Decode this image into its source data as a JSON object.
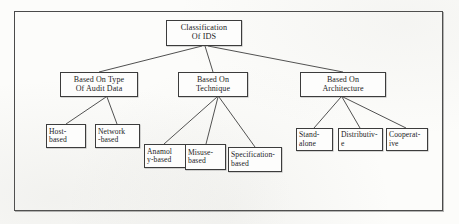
{
  "diagram": {
    "title": "Classification Of IDS",
    "type": "tree",
    "frame": {
      "present": true,
      "color": "#4a4a4a"
    },
    "root": {
      "id": "root",
      "line1": "Classification",
      "line2": "Of  IDS"
    },
    "branches": [
      {
        "id": "audit",
        "line1": "Based On Type",
        "line2": "Of Audit Data",
        "children": [
          {
            "id": "host",
            "line1": "Host-",
            "line2": "based"
          },
          {
            "id": "network",
            "line1": "Network",
            "line2": "-based"
          }
        ]
      },
      {
        "id": "technique",
        "line1": "Based On",
        "line2": "Technique",
        "children": [
          {
            "id": "anamoly",
            "line1": "Anamol",
            "line2": "y-based"
          },
          {
            "id": "misuse",
            "line1": "Misuse-",
            "line2": "based"
          },
          {
            "id": "spec",
            "line1": "Specification-",
            "line2": "based"
          }
        ]
      },
      {
        "id": "architecture",
        "line1": "Based On",
        "line2": "Architecture",
        "children": [
          {
            "id": "stand",
            "line1": "Stand-",
            "line2": "alone"
          },
          {
            "id": "distrib",
            "line1": "Distributiv-",
            "line2": "e"
          },
          {
            "id": "coop",
            "line1": "Cooperat-",
            "line2": "ive"
          }
        ]
      }
    ],
    "colors": {
      "line": "#3c3c3c",
      "box_fill": "#fdfdfc",
      "text": "#1c1c1c",
      "page": "#fcfcfa"
    }
  }
}
